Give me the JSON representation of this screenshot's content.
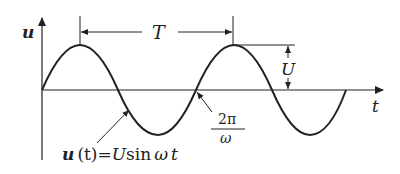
{
  "diagram": {
    "axis_labels": {
      "y": "u",
      "x": "t"
    },
    "period_label": "T",
    "amplitude_label": "U",
    "zero_crossing_label": {
      "numerator": "2π",
      "denominator": "ω"
    },
    "equation": {
      "lhs_var": "u",
      "lhs_arg": "(t)",
      "equals": "=",
      "amp": "U",
      "func": "sin",
      "omega": "ω",
      "t": "t"
    }
  }
}
